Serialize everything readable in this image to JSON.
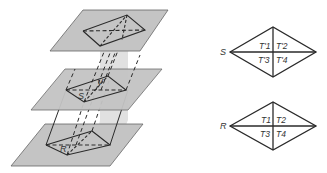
{
  "figure": {
    "left": {
      "description": "Three parallel planes intersected by a slanted prism with rhombus cross-sections",
      "labels": {
        "lower_section": "R",
        "middle_section": "S",
        "middle_vertex": "V"
      },
      "colors": {
        "plane_fill": "#bdbdbd",
        "plane_stroke": "#555555",
        "line": "#2a2a2a"
      }
    },
    "right": {
      "top_rhombus": {
        "label": "S",
        "cells": [
          "T'1",
          "T'2",
          "T'3",
          "T'4"
        ]
      },
      "bottom_rhombus": {
        "label": "R",
        "cells": [
          "T1",
          "T2",
          "T3",
          "T4"
        ]
      }
    }
  }
}
